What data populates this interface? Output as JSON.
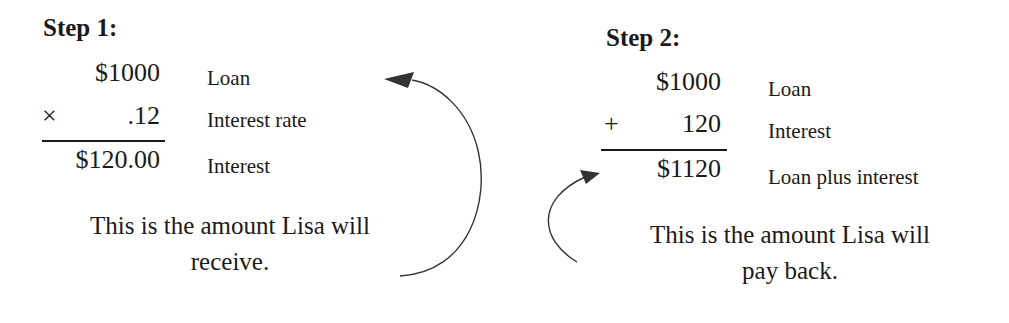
{
  "step1": {
    "title": "Step 1:",
    "rows": [
      {
        "operator": "",
        "value": "$1000",
        "label": "Loan"
      },
      {
        "operator": "×",
        "value": ".12",
        "label": "Interest rate"
      },
      {
        "operator": "",
        "value": "$120.00",
        "label": "Interest"
      }
    ],
    "caption_line1": "This is the amount Lisa will",
    "caption_line2": "receive."
  },
  "step2": {
    "title": "Step 2:",
    "rows": [
      {
        "operator": "",
        "value": "$1000",
        "label": "Loan"
      },
      {
        "operator": "+",
        "value": "120",
        "label": "Interest"
      },
      {
        "operator": "",
        "value": "$1120",
        "label": "Loan plus interest"
      }
    ],
    "caption_line1": "This is the amount Lisa will",
    "caption_line2": "pay back."
  }
}
